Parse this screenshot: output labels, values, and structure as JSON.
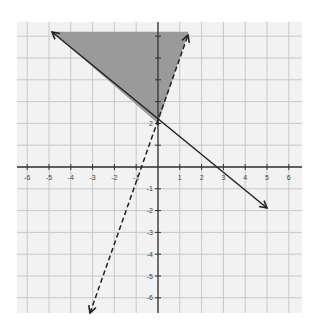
{
  "chart_data": {
    "type": "line",
    "title": "",
    "xlabel": "",
    "ylabel": "",
    "xlim": [
      -6.5,
      6.5
    ],
    "ylim": [
      -6.6,
      6.6
    ],
    "grid": true,
    "x_ticks": [
      -6,
      -5,
      -4,
      -3,
      -2,
      -1,
      1,
      2,
      3,
      4,
      5,
      6
    ],
    "y_ticks": [
      -6,
      -5,
      -4,
      -3,
      -2,
      -1,
      1,
      2
    ],
    "x_tick_labels": [
      "-6",
      "-5",
      "-4",
      "-3",
      "-2",
      "-1",
      "1",
      "2",
      "3",
      "4",
      "5",
      "6"
    ],
    "y_tick_labels": [
      "-6",
      "-5",
      "-4",
      "-3",
      "-2",
      "-1",
      "2"
    ],
    "series": [
      {
        "name": "solid boundary line",
        "style": "solid",
        "equation": "y = -0.75x + 2",
        "slope": -0.75,
        "intercept": 2,
        "x": [
          -4.86,
          5.0
        ],
        "y": [
          5.65,
          -1.75
        ],
        "arrows": "both"
      },
      {
        "name": "dashed boundary line",
        "style": "dashed",
        "equation": "y = 3x + 2",
        "slope": 3,
        "intercept": 2,
        "x": [
          -3.1,
          1.35
        ],
        "y": [
          -7.3,
          6.05
        ],
        "arrows": "both"
      }
    ],
    "shaded_region": {
      "description": "region above the solid line and to the left of (above) the dashed line",
      "vertices": [
        [
          -4.86,
          6.2
        ],
        [
          1.4,
          6.2
        ],
        [
          0,
          2
        ]
      ],
      "color": "#9a9a9a"
    },
    "intersection_point": [
      0,
      2
    ],
    "colors": {
      "grid": "#c8c8c8",
      "background": "#f2f2f2",
      "axis": "#333333",
      "line": "#222222",
      "shade": "#9a9a9a"
    }
  }
}
